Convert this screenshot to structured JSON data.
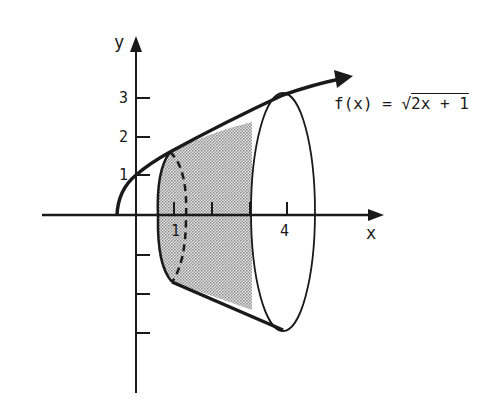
{
  "diagram": {
    "function_label": "f(x) = ",
    "function_radical": "2x + 1",
    "function_sqrt_symbol": "√",
    "axes": {
      "x_label": "x",
      "y_label": "y"
    },
    "x_ticks": [
      {
        "value": 1,
        "label": "1"
      },
      {
        "value": 2,
        "label": ""
      },
      {
        "value": 3,
        "label": ""
      },
      {
        "value": 4,
        "label": "4"
      }
    ],
    "y_ticks": [
      {
        "value": 1,
        "label": "1"
      },
      {
        "value": 2,
        "label": "2"
      },
      {
        "value": 3,
        "label": "3"
      },
      {
        "value": -1,
        "label": ""
      },
      {
        "value": -2,
        "label": ""
      },
      {
        "value": -3,
        "label": ""
      }
    ],
    "shaded_region": {
      "x_from": 0.6,
      "x_to": 3
    },
    "colors": {
      "ink": "#1a1a1a",
      "shade": "#b8b8b8",
      "background": "#ffffff"
    }
  }
}
